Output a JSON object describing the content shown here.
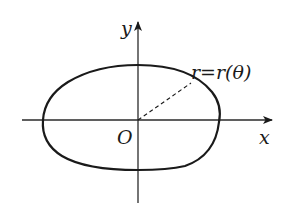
{
  "diagram": {
    "colors": {
      "background": "#ffffff",
      "stroke": "#1a1a1a",
      "axis": "#2a2a2a"
    },
    "axes": {
      "x_label": "x",
      "y_label": "y",
      "origin_label": "O"
    },
    "curve": {
      "label": "r=r(θ)",
      "type": "closed oval curve",
      "radius_line": "dashed"
    }
  }
}
